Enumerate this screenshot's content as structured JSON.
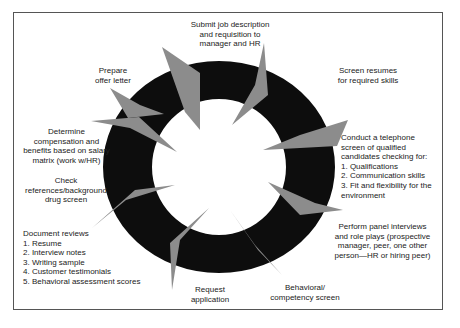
{
  "title_cutoff": "",
  "colors": {
    "ring": "#0d0d0d",
    "arrow": "#8c8c8c",
    "frame": "#555555",
    "text": "#222222",
    "background": "#ffffff"
  },
  "cycle": {
    "steps": [
      {
        "id": "submit",
        "lines": [
          "Submit job description",
          "and requisition to",
          "manager and HR"
        ]
      },
      {
        "id": "screen-resumes",
        "lines": [
          "Screen resumes",
          "for required skills"
        ]
      },
      {
        "id": "telephone-screen",
        "intro": [
          "Conduct a telephone",
          "screen of qualified",
          "candidates checking for:"
        ],
        "items": [
          "1. Qualifications",
          "2. Communication skills",
          "3. Fit and flexibility for the",
          "environment"
        ]
      },
      {
        "id": "panel-interviews",
        "lines": [
          "Perform panel interviews",
          "and role plays (prospective",
          "manager, peer, one other",
          "person—HR or hiring peer)"
        ]
      },
      {
        "id": "behavioral-screen",
        "lines": [
          "Behavioral/",
          "competency screen"
        ]
      },
      {
        "id": "request-application",
        "lines": [
          "Request",
          "application"
        ]
      },
      {
        "id": "document-reviews",
        "intro": [
          "Document reviews"
        ],
        "items": [
          "1. Resume",
          "2. Interview notes",
          "3. Writing sample",
          "4. Customer testimonials",
          "5. Behavioral assessment scores"
        ]
      },
      {
        "id": "check-references",
        "lines": [
          "Check",
          "references/background",
          "drug screen"
        ]
      },
      {
        "id": "determine-compensation",
        "lines": [
          "Determine",
          "compensation and",
          "benefits based on salary",
          "matrix (work w/HR)"
        ]
      },
      {
        "id": "prepare-offer",
        "lines": [
          "Prepare",
          "offer letter"
        ]
      }
    ]
  }
}
